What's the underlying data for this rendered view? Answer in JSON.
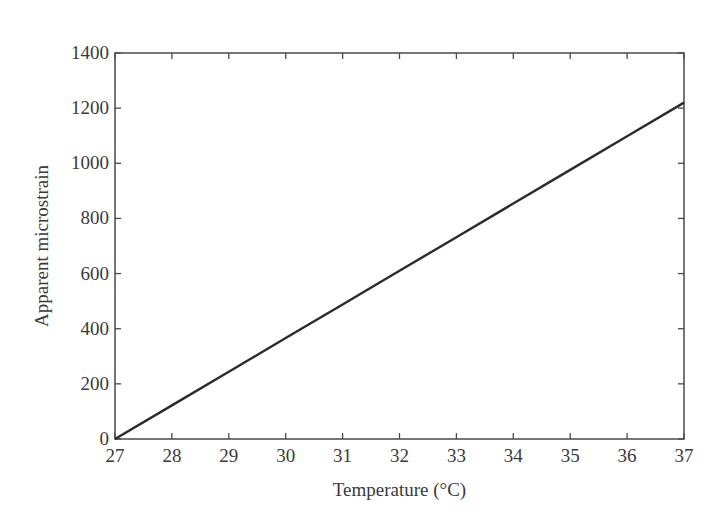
{
  "chart_data": {
    "type": "line",
    "title": "",
    "xlabel": "Temperature (°C)",
    "ylabel": "Apparent microstrain",
    "xlim": [
      27,
      37
    ],
    "ylim": [
      0,
      1400
    ],
    "xticks": [
      27,
      28,
      29,
      30,
      31,
      32,
      33,
      34,
      35,
      36,
      37
    ],
    "yticks": [
      0,
      200,
      400,
      600,
      800,
      1000,
      1200,
      1400
    ],
    "grid": false,
    "legend": null,
    "series": [
      {
        "name": "Apparent microstrain vs temperature",
        "x": [
          27,
          28,
          29,
          30,
          31,
          32,
          33,
          34,
          35,
          36,
          37
        ],
        "values": [
          0,
          122,
          244,
          366,
          488,
          610,
          732,
          854,
          976,
          1098,
          1220
        ],
        "color": "#2b2b2b"
      }
    ]
  },
  "colors": {
    "line": "#2b2b2b",
    "axis": "#4a4a4a",
    "text": "#3a3a3a",
    "background": "#ffffff"
  }
}
